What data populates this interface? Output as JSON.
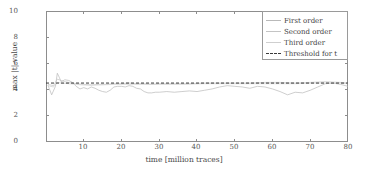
{
  "chart_data": {
    "type": "line",
    "title": "",
    "xlabel": "time [million traces]",
    "ylabel": "max |t|-value",
    "xlim": [
      0,
      80
    ],
    "ylim": [
      0,
      10
    ],
    "xticks": [
      10,
      20,
      30,
      40,
      50,
      60,
      70,
      80
    ],
    "yticks": [
      0,
      2,
      4,
      6,
      8,
      10
    ],
    "grid": false,
    "legend_position": "top-right",
    "threshold_value": 4.5,
    "colors": {
      "first_order": "#b9b9b9",
      "second_order": "#c4c4c4",
      "third_order": "#cfcfcf",
      "threshold": "#3a3a3a",
      "axis": "#8d8d8d",
      "text": "#4a4a4a"
    },
    "series": [
      {
        "name": "First order",
        "style": "solid",
        "color": "#b9b9b9",
        "x": [
          0.5,
          1.5,
          2.5,
          3.0,
          3.5,
          4.0,
          5.0,
          6.0,
          7.0,
          8.0,
          9.0,
          10.0,
          11.0,
          12.0,
          13.0,
          14.0,
          15.0,
          16.0,
          17.0,
          18.0,
          19.0,
          20.0,
          21.0,
          22.0,
          23.0,
          24.0,
          25.0,
          26.0,
          27.0,
          28.0,
          29.0,
          30.0,
          32.0,
          34.0,
          36.0,
          38.0,
          40.0,
          42.0,
          44.0,
          46.0,
          48.0,
          50.0,
          52.0,
          54.0,
          56.0,
          58.0,
          60.0,
          62.0,
          64.0,
          66.0,
          68.0,
          70.0,
          72.0,
          74.0,
          76.0,
          78.0,
          80.0
        ],
        "y": [
          4.35,
          3.6,
          4.25,
          5.25,
          4.95,
          4.6,
          4.75,
          4.7,
          4.55,
          4.25,
          4.05,
          4.15,
          4.05,
          4.2,
          4.1,
          3.95,
          3.85,
          3.8,
          3.95,
          4.2,
          4.25,
          4.25,
          4.2,
          4.3,
          4.25,
          4.1,
          4.05,
          3.85,
          3.75,
          3.75,
          3.8,
          3.8,
          3.85,
          3.8,
          3.85,
          3.9,
          3.85,
          3.95,
          4.05,
          4.2,
          4.3,
          4.25,
          4.2,
          4.1,
          4.25,
          4.2,
          4.05,
          3.85,
          3.6,
          3.8,
          3.75,
          3.95,
          4.2,
          4.45,
          4.5,
          4.4,
          4.25
        ]
      },
      {
        "name": "Second order",
        "style": "solid",
        "color": "#c4c4c4",
        "x": [
          0.5,
          2.0,
          3.0,
          4.0,
          5.0,
          6.0,
          8.0,
          10.0,
          12.0,
          14.0,
          16.0,
          18.0,
          20.0,
          22.0,
          24.0,
          26.0,
          28.0,
          30.0,
          34.0,
          38.0,
          42.0,
          46.0,
          50.0,
          54.0,
          58.0,
          62.0,
          66.0,
          70.0,
          74.0,
          78.0,
          80.0
        ],
        "y": [
          4.4,
          4.3,
          4.8,
          4.7,
          4.6,
          4.55,
          4.45,
          4.4,
          4.35,
          4.4,
          4.4,
          4.45,
          4.45,
          4.5,
          4.45,
          4.45,
          4.4,
          4.45,
          4.45,
          4.45,
          4.5,
          4.5,
          4.5,
          4.5,
          4.55,
          4.55,
          4.5,
          4.55,
          4.6,
          4.55,
          4.5
        ]
      },
      {
        "name": "Third order",
        "style": "solid",
        "color": "#cfcfcf",
        "x": [
          0.5,
          2.0,
          3.0,
          4.0,
          6.0,
          8.0,
          10.0,
          14.0,
          18.0,
          22.0,
          26.0,
          30.0,
          36.0,
          42.0,
          48.0,
          54.0,
          60.0,
          66.0,
          72.0,
          78.0,
          80.0
        ],
        "y": [
          4.3,
          4.2,
          4.55,
          4.5,
          4.45,
          4.4,
          4.35,
          4.35,
          4.4,
          4.4,
          4.4,
          4.4,
          4.4,
          4.45,
          4.45,
          4.45,
          4.45,
          4.45,
          4.5,
          4.5,
          4.45
        ]
      },
      {
        "name": "Threshold for t",
        "style": "dashed",
        "color": "#3a3a3a",
        "x": [
          0,
          80
        ],
        "y": [
          4.5,
          4.5
        ]
      }
    ]
  },
  "axes": {
    "ylabel": "max |t|-value",
    "xlabel": "time [million traces]",
    "yticks": [
      "0",
      "2",
      "4",
      "6",
      "8",
      "10"
    ],
    "xticks": [
      "10",
      "20",
      "30",
      "40",
      "50",
      "60",
      "70",
      "80"
    ]
  },
  "legend": {
    "items": [
      {
        "label": "First order",
        "style": "solid",
        "color": "#b9b9b9"
      },
      {
        "label": "Second order",
        "style": "solid",
        "color": "#c4c4c4"
      },
      {
        "label": "Third order",
        "style": "solid",
        "color": "#cfcfcf"
      },
      {
        "label": "Threshold for t",
        "style": "dashed",
        "color": "#3a3a3a"
      }
    ]
  }
}
